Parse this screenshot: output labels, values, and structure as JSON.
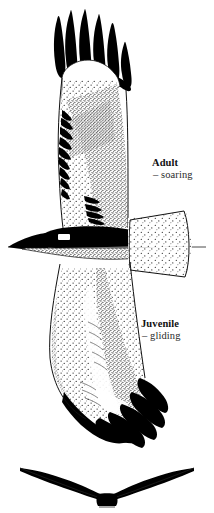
{
  "illustration": {
    "title": "Raptor in flight - underside plate",
    "subject": "bird-of-prey",
    "style": "stipple-ink-field-guide",
    "background_color": "#ffffff",
    "ink_color": "#000000",
    "stipple_color": "#2a2a2a",
    "outline_color": "#111111",
    "horizon_line_color": "#4a4a4a"
  },
  "labels": {
    "adult": {
      "title": "Adult",
      "subtitle": "– soaring"
    },
    "juvenile": {
      "title": "Juvenile",
      "subtitle": "– gliding"
    }
  },
  "figures": {
    "main_bird": {
      "name": "raptor-underside-view",
      "upper_wing": "adult-soaring-wing",
      "lower_wing": "juvenile-gliding-wing",
      "body": "dark-body-with-white-patch",
      "tail": "stippled-fanned-tail",
      "head": "dark-head-pointing-left",
      "primaries": "black-fingered-primaries"
    },
    "silhouette": {
      "name": "head-on-dihedral-silhouette",
      "description": "front view showing raised dihedral wings"
    }
  }
}
